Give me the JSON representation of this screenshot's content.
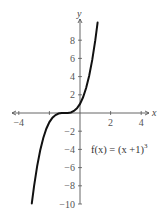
{
  "chart_data": {
    "type": "line",
    "title": "",
    "xlabel": "x",
    "ylabel": "y",
    "xlim": [
      -4.5,
      4.5
    ],
    "ylim": [
      -10,
      10
    ],
    "grid": false,
    "legend": "none",
    "x_ticks": [
      -4,
      -2,
      2,
      4
    ],
    "x_tick_labels": [
      "−4",
      "",
      "2",
      "4"
    ],
    "y_ticks": [
      8,
      6,
      4,
      2,
      -2,
      -4,
      -6,
      -8,
      -10
    ],
    "y_tick_labels": [
      "8",
      "6",
      "4",
      "2",
      "−2",
      "−4",
      "−6",
      "−8",
      "−10"
    ],
    "annotation": "f(x) = (x +1)",
    "annotation_exponent": "3",
    "series": [
      {
        "name": "f(x) = (x+1)^3",
        "function": "(x+1)^3",
        "color": "#111111",
        "x": [
          -3.15,
          -3.0,
          -2.8,
          -2.6,
          -2.4,
          -2.2,
          -2.0,
          -1.8,
          -1.6,
          -1.4,
          -1.2,
          -1.0,
          -0.8,
          -0.6,
          -0.4,
          -0.2,
          0.0,
          0.2,
          0.4,
          0.6,
          0.8,
          1.0,
          1.15
        ],
        "y": [
          -9.94,
          -8.0,
          -5.83,
          -4.1,
          -2.74,
          -1.73,
          -1.0,
          -0.51,
          -0.22,
          -0.06,
          -0.01,
          0.0,
          0.01,
          0.06,
          0.22,
          0.51,
          1.0,
          1.73,
          2.74,
          4.1,
          5.83,
          8.0,
          9.94
        ]
      }
    ]
  }
}
